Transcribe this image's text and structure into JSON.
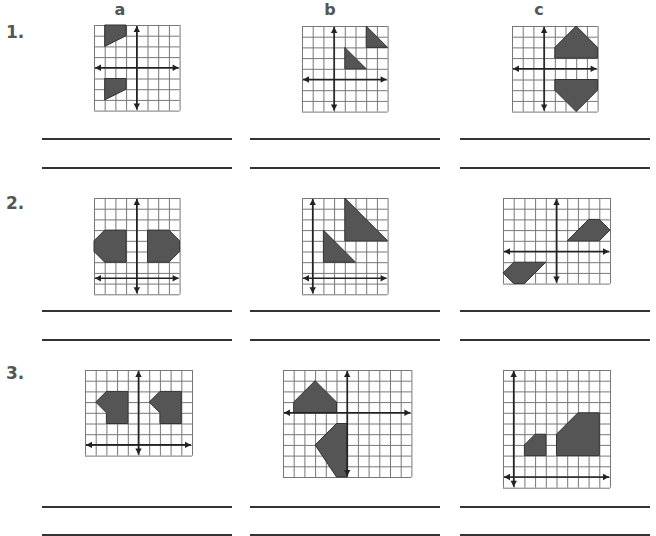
{
  "columns": [
    {
      "label": "a",
      "x": 120
    },
    {
      "label": "b",
      "x": 330
    },
    {
      "label": "c",
      "x": 539
    }
  ],
  "rows": [
    {
      "label": "1.",
      "y": 33
    },
    {
      "label": "2.",
      "y": 204
    },
    {
      "label": "3.",
      "y": 374
    }
  ],
  "answer_lines": {
    "x_ranges": [
      [
        42,
        232
      ],
      [
        250,
        440
      ],
      [
        460,
        650
      ]
    ],
    "y_positions": [
      138,
      167,
      310,
      339,
      506,
      534
    ]
  },
  "colors": {
    "grid_line": "#777777",
    "axis": "#222222",
    "shape_fill": "#555555",
    "shape_stroke": "#333333"
  },
  "grids": [
    {
      "id": "1a",
      "x": 94,
      "y": 25,
      "cols": 8,
      "rows": 8,
      "cell": 10.7,
      "vaxis": 4,
      "haxis": 4,
      "shapes": [
        [
          [
            1,
            0
          ],
          [
            3,
            0
          ],
          [
            3,
            1
          ],
          [
            1,
            2
          ]
        ],
        [
          [
            1,
            5
          ],
          [
            3,
            5
          ],
          [
            3,
            6
          ],
          [
            1,
            7
          ]
        ]
      ]
    },
    {
      "id": "1b",
      "x": 302,
      "y": 26,
      "cols": 8,
      "rows": 8,
      "cell": 10.7,
      "vaxis": 3,
      "haxis": 5,
      "shapes": [
        [
          [
            6,
            0
          ],
          [
            6,
            2
          ],
          [
            8,
            2
          ]
        ],
        [
          [
            4,
            2
          ],
          [
            4,
            4
          ],
          [
            6,
            4
          ]
        ]
      ]
    },
    {
      "id": "1c",
      "x": 512,
      "y": 26,
      "cols": 8,
      "rows": 8,
      "cell": 10.7,
      "vaxis": 3,
      "haxis": 4,
      "shapes": [
        [
          [
            6,
            0
          ],
          [
            8,
            2
          ],
          [
            8,
            3
          ],
          [
            4,
            3
          ],
          [
            4,
            2
          ]
        ],
        [
          [
            4,
            5
          ],
          [
            8,
            5
          ],
          [
            8,
            6
          ],
          [
            6,
            8
          ],
          [
            4,
            6
          ]
        ]
      ]
    },
    {
      "id": "2a",
      "x": 94,
      "y": 198,
      "cols": 8,
      "rows": 9,
      "cell": 10.7,
      "vaxis": 4,
      "haxis": 7.5,
      "shapes": [
        [
          [
            1,
            3
          ],
          [
            3,
            3
          ],
          [
            3,
            6
          ],
          [
            1,
            6
          ],
          [
            0,
            5
          ],
          [
            0,
            4
          ]
        ],
        [
          [
            5,
            3
          ],
          [
            7,
            3
          ],
          [
            8,
            4
          ],
          [
            8,
            5
          ],
          [
            7,
            6
          ],
          [
            5,
            6
          ]
        ]
      ]
    },
    {
      "id": "2b",
      "x": 302,
      "y": 198,
      "cols": 8,
      "rows": 9,
      "cell": 10.7,
      "vaxis": 1,
      "haxis": 7.5,
      "shapes": [
        [
          [
            4,
            0
          ],
          [
            4,
            4
          ],
          [
            8,
            4
          ]
        ],
        [
          [
            2,
            3
          ],
          [
            2,
            6
          ],
          [
            5,
            6
          ]
        ]
      ]
    },
    {
      "id": "2c",
      "x": 503,
      "y": 198,
      "cols": 10,
      "rows": 8,
      "cell": 10.7,
      "vaxis": 5,
      "haxis": 5,
      "shapes": [
        [
          [
            8,
            2
          ],
          [
            9,
            2
          ],
          [
            10,
            3
          ],
          [
            9,
            4
          ],
          [
            6,
            4
          ]
        ],
        [
          [
            1,
            6
          ],
          [
            4,
            6
          ],
          [
            2,
            8
          ],
          [
            1,
            8
          ],
          [
            0,
            7
          ]
        ]
      ]
    },
    {
      "id": "3a",
      "x": 85,
      "y": 370,
      "cols": 10,
      "rows": 8,
      "cell": 10.7,
      "vaxis": 5,
      "haxis": 7,
      "shapes": [
        [
          [
            2,
            2
          ],
          [
            4,
            2
          ],
          [
            4,
            5
          ],
          [
            2,
            5
          ],
          [
            2,
            4
          ],
          [
            1,
            3
          ]
        ],
        [
          [
            7,
            2
          ],
          [
            9,
            2
          ],
          [
            9,
            5
          ],
          [
            7,
            5
          ],
          [
            7,
            4
          ],
          [
            6,
            3
          ]
        ]
      ]
    },
    {
      "id": "3b",
      "x": 283,
      "y": 370,
      "cols": 12,
      "rows": 10,
      "cell": 10.7,
      "vaxis": 6,
      "haxis": 4,
      "shapes": [
        [
          [
            3,
            1
          ],
          [
            5,
            3
          ],
          [
            5,
            4
          ],
          [
            1,
            4
          ],
          [
            1,
            3
          ]
        ],
        [
          [
            5,
            5
          ],
          [
            6,
            5
          ],
          [
            6,
            10
          ],
          [
            5,
            10
          ],
          [
            3,
            7
          ]
        ]
      ]
    },
    {
      "id": "3c",
      "x": 503,
      "y": 370,
      "cols": 10,
      "rows": 11,
      "cell": 10.7,
      "vaxis": 1,
      "haxis": 10,
      "shapes": [
        [
          [
            3,
            6
          ],
          [
            4,
            6
          ],
          [
            4,
            8
          ],
          [
            2,
            8
          ],
          [
            2,
            7
          ]
        ],
        [
          [
            7,
            4
          ],
          [
            9,
            4
          ],
          [
            9,
            8
          ],
          [
            5,
            8
          ],
          [
            5,
            6
          ]
        ]
      ]
    }
  ]
}
